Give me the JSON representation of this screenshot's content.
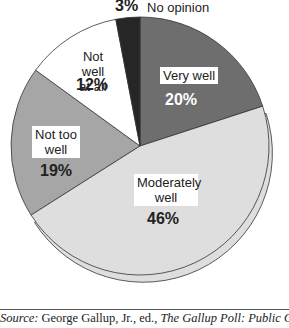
{
  "chart_data": {
    "type": "pie",
    "title": "",
    "slices": [
      {
        "label": "Very well",
        "value": 20,
        "display": "20%",
        "color": "#6e6e6e"
      },
      {
        "label": "Moderately well",
        "value": 46,
        "display": "46%",
        "color": "#dedede",
        "exploded": true
      },
      {
        "label": "Not too well",
        "value": 19,
        "display": "19%",
        "color": "#a6a6a6"
      },
      {
        "label": "Not well at all",
        "value": 12,
        "display": "12%",
        "color": "#ffffff"
      },
      {
        "label": "No opinion",
        "value": 3,
        "display": "3%",
        "color": "#262626"
      }
    ],
    "start_angle_deg": 0,
    "direction": "clockwise"
  },
  "labels": {
    "very_well": "Very well",
    "very_well_pct": "20%",
    "moderately_1": "Moderately",
    "moderately_2": "well",
    "moderately_pct": "46%",
    "not_too_1": "Not too",
    "not_too_2": "well",
    "not_too_pct": "19%",
    "not_well_1": "Not well",
    "not_well_2": "at all",
    "not_well_pct": "12%",
    "no_opinion_pct": "3%",
    "no_opinion": "No opinion"
  },
  "source": {
    "prefix": "Source:",
    "text1": " George Gallup, Jr., ed., ",
    "title": "The Gallup Poll: Public Opinion,"
  }
}
